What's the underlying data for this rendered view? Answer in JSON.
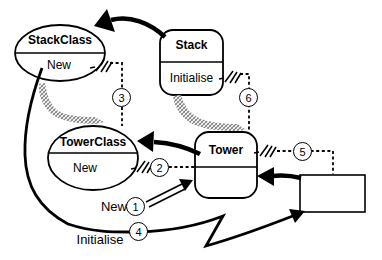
{
  "diagram": {
    "nodes": {
      "stack_class": {
        "title": "StackClass",
        "operation": "New"
      },
      "stack": {
        "title": "Stack",
        "operation": "Initialise"
      },
      "tower_class": {
        "title": "TowerClass",
        "operation": "New"
      },
      "tower": {
        "title": "Tower",
        "operation": ""
      }
    },
    "markers": {
      "m1": "1",
      "m2": "2",
      "m3": "3",
      "m4": "4",
      "m5": "5",
      "m6": "6"
    },
    "labels": {
      "new": "New",
      "initialise": "Initialise"
    },
    "colors": {
      "ink": "#000000",
      "background": "#ffffff",
      "hatch_gray": "#7d7d7d"
    }
  }
}
